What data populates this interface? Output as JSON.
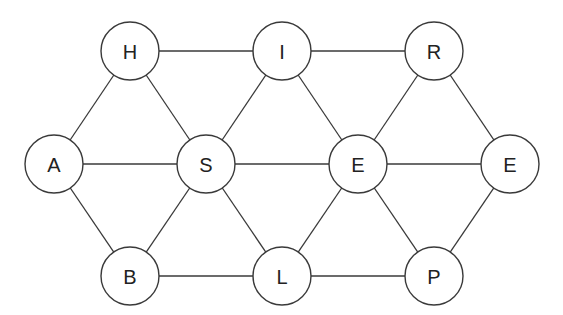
{
  "diagram": {
    "type": "graph",
    "node_radius": 29,
    "nodes": [
      {
        "id": "H",
        "label": "H",
        "x": 130,
        "y": 51
      },
      {
        "id": "I",
        "label": "I",
        "x": 282,
        "y": 51
      },
      {
        "id": "R",
        "label": "R",
        "x": 434,
        "y": 51
      },
      {
        "id": "A",
        "label": "A",
        "x": 54,
        "y": 164
      },
      {
        "id": "S",
        "label": "S",
        "x": 206,
        "y": 164
      },
      {
        "id": "E1",
        "label": "E",
        "x": 358,
        "y": 164
      },
      {
        "id": "E2",
        "label": "E",
        "x": 510,
        "y": 164
      },
      {
        "id": "B",
        "label": "B",
        "x": 130,
        "y": 276
      },
      {
        "id": "L",
        "label": "L",
        "x": 282,
        "y": 276
      },
      {
        "id": "P",
        "label": "P",
        "x": 434,
        "y": 276
      }
    ],
    "edges": [
      [
        "H",
        "I"
      ],
      [
        "I",
        "R"
      ],
      [
        "A",
        "H"
      ],
      [
        "H",
        "S"
      ],
      [
        "S",
        "I"
      ],
      [
        "I",
        "E1"
      ],
      [
        "E1",
        "R"
      ],
      [
        "R",
        "E2"
      ],
      [
        "A",
        "S"
      ],
      [
        "S",
        "E1"
      ],
      [
        "E1",
        "E2"
      ],
      [
        "A",
        "B"
      ],
      [
        "B",
        "S"
      ],
      [
        "S",
        "L"
      ],
      [
        "L",
        "E1"
      ],
      [
        "E1",
        "P"
      ],
      [
        "P",
        "E2"
      ],
      [
        "B",
        "L"
      ],
      [
        "L",
        "P"
      ]
    ]
  }
}
